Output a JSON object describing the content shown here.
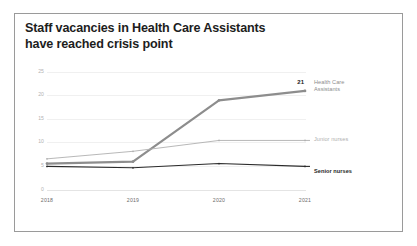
{
  "card": {
    "border_color": "#9a9a9a",
    "background": "#ffffff"
  },
  "title": {
    "line1": "Staff vacancies in Health Care Assistants",
    "line2": "have reached crisis point"
  },
  "chart_data": {
    "type": "line",
    "title": "Staff vacancies in Health Care Assistants have reached crisis point",
    "xlabel": "",
    "ylabel": "",
    "categories": [
      "2018",
      "2019",
      "2020",
      "2021"
    ],
    "yticks": [
      "0",
      "5",
      "10",
      "15",
      "20",
      "25"
    ],
    "ylim": [
      0,
      25
    ],
    "grid": true,
    "legend_position": "right-of-line-end",
    "series": [
      {
        "name": "Health Care Assistants",
        "color": "#8d8d8d",
        "width": 2.2,
        "values": [
          5.6,
          6.0,
          19.0,
          21.0
        ],
        "end_label": "21"
      },
      {
        "name": "Junior nurses",
        "color": "#b0b0b0",
        "width": 0.9,
        "values": [
          6.6,
          8.2,
          10.5,
          10.5
        ],
        "end_label": ""
      },
      {
        "name": "Senior nurses",
        "color": "#2b2b2b",
        "width": 1.1,
        "values": [
          5.0,
          4.7,
          5.6,
          5.0
        ],
        "end_label": ""
      }
    ],
    "annotations": [
      {
        "text": "21",
        "series": "Health Care Assistants",
        "x": "2021"
      }
    ]
  },
  "legend": {
    "hca_line1": "Health Care",
    "hca_line2": "Assistants",
    "junior": "Junior nurses",
    "senior": "Senior nurses"
  }
}
